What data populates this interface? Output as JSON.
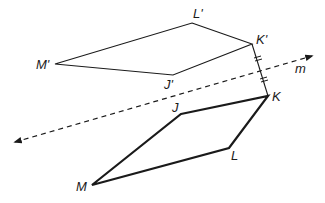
{
  "diagram": {
    "line": {
      "label": "m"
    },
    "preimage": {
      "vertices": {
        "J": "J",
        "K": "K",
        "L": "L",
        "M": "M"
      }
    },
    "image": {
      "vertices": {
        "J": "J'",
        "K": "K'",
        "L": "L'",
        "M": "M'"
      }
    },
    "colors": {
      "stroke": "#1a1a1a",
      "background": "#ffffff"
    }
  }
}
